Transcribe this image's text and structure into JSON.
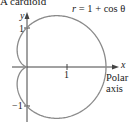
{
  "figure": {
    "title": "A cardioid",
    "equation": {
      "lhs": "r",
      "rhs": "= 1 + cos θ"
    },
    "axes": {
      "x_label": "x",
      "y_label": "y",
      "x_tick": "1",
      "y_tick_pos": "1",
      "y_tick_neg": "−1",
      "polar_axis_label_line1": "Polar",
      "polar_axis_label_line2": "axis"
    },
    "colors": {
      "curve": "#8a8a8a",
      "axes": "#444444",
      "text": "#222222"
    }
  }
}
